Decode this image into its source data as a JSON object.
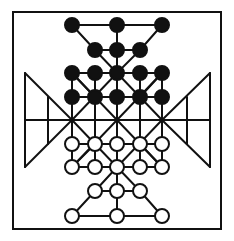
{
  "diagram": {
    "title": "",
    "colors": {
      "background": "#ffffff",
      "line": "#111111",
      "black_piece": "#111111",
      "white_piece": "#ffffff"
    },
    "frame": {
      "x1": 13,
      "y1": 12,
      "x2": 221,
      "y2": 229
    },
    "columns": [
      72,
      95,
      117,
      140,
      162
    ],
    "rows": [
      25,
      50,
      73,
      97,
      120,
      144,
      167,
      191,
      216
    ],
    "black_pieces": [
      [
        72,
        25
      ],
      [
        117,
        25
      ],
      [
        162,
        25
      ],
      [
        95,
        50
      ],
      [
        117,
        50
      ],
      [
        140,
        50
      ],
      [
        72,
        73
      ],
      [
        95,
        73
      ],
      [
        117,
        73
      ],
      [
        140,
        73
      ],
      [
        162,
        73
      ],
      [
        72,
        97
      ],
      [
        95,
        97
      ],
      [
        117,
        97
      ],
      [
        140,
        97
      ],
      [
        162,
        97
      ]
    ],
    "white_pieces": [
      [
        72,
        144
      ],
      [
        95,
        144
      ],
      [
        117,
        144
      ],
      [
        140,
        144
      ],
      [
        162,
        144
      ],
      [
        72,
        167
      ],
      [
        95,
        167
      ],
      [
        117,
        167
      ],
      [
        140,
        167
      ],
      [
        162,
        167
      ],
      [
        95,
        191
      ],
      [
        117,
        191
      ],
      [
        140,
        191
      ],
      [
        72,
        216
      ],
      [
        117,
        216
      ],
      [
        162,
        216
      ]
    ],
    "piece_radius": 7,
    "black_count": 16,
    "white_count": 16
  }
}
